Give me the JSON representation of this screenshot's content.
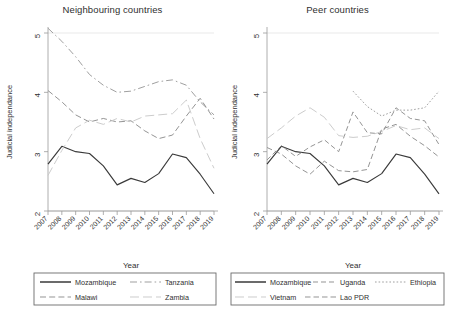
{
  "figure": {
    "xlabel": "Year",
    "ylabel": "Judicial independance",
    "yticks": [
      "2",
      "3",
      "4",
      "5"
    ],
    "ylim": [
      2,
      5
    ],
    "xticks": [
      "2007",
      "2008",
      "2009",
      "2010",
      "2011",
      "2012",
      "2013",
      "2014",
      "2015",
      "2016",
      "2017",
      "2018",
      "2019"
    ]
  },
  "panels": [
    {
      "title": "Neighbouring countries",
      "legend": [
        {
          "label": "Mozambique",
          "style": "solid"
        },
        {
          "label": "Tanzania",
          "style": "dashdot"
        },
        {
          "label": "Malawi",
          "style": "longdash"
        },
        {
          "label": "Zambia",
          "style": "lightdash"
        }
      ]
    },
    {
      "title": "Peer countries",
      "legend": [
        {
          "label": "Mozambique",
          "style": "solid"
        },
        {
          "label": "Uganda",
          "style": "dash"
        },
        {
          "label": "Ethiopia",
          "style": "dash2"
        },
        {
          "label": "Vietnam",
          "style": "lightdash"
        },
        {
          "label": "Lao PDR",
          "style": "dash3"
        }
      ]
    }
  ],
  "chart_data": {
    "type": "line",
    "xlabel": "Year",
    "ylabel": "Judicial independance",
    "ylim": [
      2,
      5
    ],
    "grid": false,
    "legend_position": "bottom",
    "x": [
      2007,
      2008,
      2009,
      2010,
      2011,
      2012,
      2013,
      2014,
      2015,
      2016,
      2017,
      2018,
      2019
    ],
    "panels": [
      {
        "name": "Neighbouring countries",
        "series": [
          {
            "name": "Mozambique",
            "style": "solid",
            "values": [
              2.79,
              3.09,
              3.0,
              2.97,
              2.76,
              2.44,
              2.55,
              2.48,
              2.63,
              2.96,
              2.9,
              2.62,
              2.29
            ]
          },
          {
            "name": "Tanzania",
            "style": "dashdot",
            "values": [
              5.08,
              4.86,
              4.6,
              4.3,
              4.12,
              4.0,
              4.02,
              4.1,
              4.18,
              4.21,
              4.12,
              3.84,
              3.62
            ]
          },
          {
            "name": "Malawi",
            "style": "longdash",
            "values": [
              4.03,
              3.84,
              3.62,
              3.5,
              3.56,
              3.5,
              3.52,
              3.35,
              3.22,
              3.28,
              3.6,
              3.9,
              3.55
            ]
          },
          {
            "name": "Zambia",
            "style": "lightdash",
            "values": [
              2.6,
              3.02,
              3.4,
              3.53,
              3.46,
              3.56,
              3.5,
              3.6,
              3.62,
              3.64,
              3.87,
              3.22,
              2.72
            ]
          }
        ]
      },
      {
        "name": "Peer countries",
        "series": [
          {
            "name": "Mozambique",
            "style": "solid",
            "values": [
              2.79,
              3.09,
              3.0,
              2.97,
              2.76,
              2.44,
              2.55,
              2.48,
              2.63,
              2.96,
              2.9,
              2.62,
              2.29
            ]
          },
          {
            "name": "Uganda",
            "style": "dash",
            "values": [
              2.86,
              3.1,
              2.92,
              3.08,
              3.2,
              3.0,
              3.67,
              3.32,
              3.3,
              3.74,
              3.56,
              3.52,
              3.12
            ]
          },
          {
            "name": "Ethiopia",
            "style": "dash2",
            "values": [
              null,
              null,
              null,
              null,
              null,
              null,
              4.02,
              3.76,
              3.6,
              3.7,
              3.7,
              3.74,
              4.02
            ]
          },
          {
            "name": "Vietnam",
            "style": "lightdash",
            "values": [
              3.22,
              3.4,
              3.6,
              3.74,
              3.58,
              3.27,
              3.24,
              3.26,
              3.34,
              3.44,
              3.37,
              3.4,
              3.22
            ]
          },
          {
            "name": "Lao PDR",
            "style": "dash3",
            "values": [
              3.07,
              2.96,
              2.76,
              2.62,
              2.84,
              2.68,
              2.66,
              2.7,
              3.38,
              3.46,
              3.26,
              3.1,
              2.91
            ]
          }
        ]
      }
    ]
  }
}
